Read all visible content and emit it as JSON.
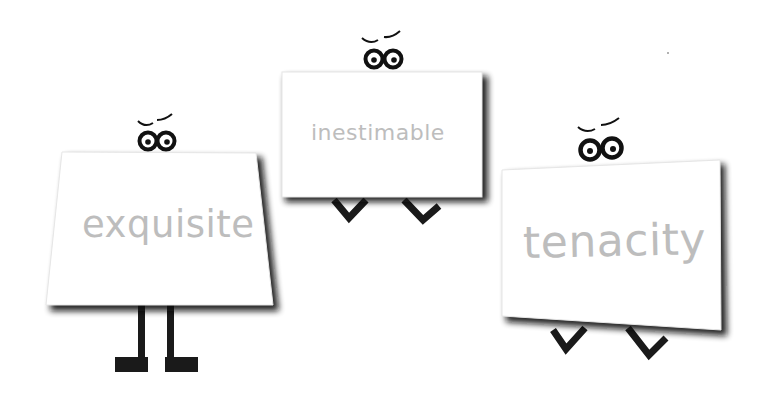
{
  "scene": {
    "description": "Three cartoon sign-board characters with eyes, each displaying a vocabulary word",
    "background": "#ffffff",
    "characters": [
      {
        "word": "exquisite",
        "legs": "standing legs with block feet"
      },
      {
        "word": "inestimable",
        "legs": "bent legs (V-shapes)"
      },
      {
        "word": "tenacity",
        "legs": "bent legs (V-shapes)"
      }
    ],
    "colors": {
      "card_fill": "#ffffff",
      "card_shadow": "#1a1a1a",
      "word_text": "#bdbdbd",
      "ink": "#111111"
    }
  }
}
